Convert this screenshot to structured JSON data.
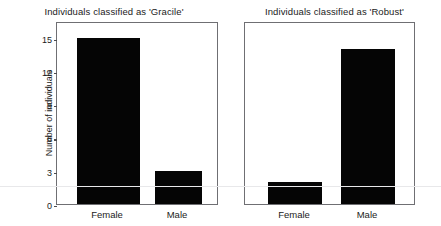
{
  "figure": {
    "background": "#ffffff",
    "bar_color": "#050505",
    "frame_color": "#6f6f73",
    "artifact_rule_y": 186
  },
  "panels": [
    {
      "id": "gracile",
      "title": "Individuals classified as 'Gracile'",
      "ylabel": "Number of individuals",
      "yticks": [
        "0",
        "3",
        "6",
        "9",
        "12",
        "15"
      ],
      "xticks": [
        "Female",
        "Male"
      ],
      "show_yaxis": true
    },
    {
      "id": "robust",
      "title": "Individuals classified as 'Robust'",
      "ylabel": "",
      "yticks": [],
      "xticks": [
        "Female",
        "Male"
      ],
      "show_yaxis": false
    }
  ],
  "chart_data": [
    {
      "type": "bar",
      "title": "Individuals classified as 'Gracile'",
      "categories": [
        "Female",
        "Male"
      ],
      "values": [
        15,
        3
      ],
      "xlabel": "",
      "ylabel": "Number of individuals",
      "ylim": [
        0,
        16
      ],
      "yticks": [
        0,
        3,
        6,
        9,
        12,
        15
      ],
      "grid": false,
      "legend": "none",
      "bar_color": "#050505"
    },
    {
      "type": "bar",
      "title": "Individuals classified as 'Robust'",
      "categories": [
        "Female",
        "Male"
      ],
      "values": [
        2,
        14
      ],
      "xlabel": "",
      "ylabel": "",
      "ylim": [
        0,
        16
      ],
      "yticks": [],
      "grid": false,
      "legend": "none",
      "bar_color": "#050505"
    }
  ]
}
